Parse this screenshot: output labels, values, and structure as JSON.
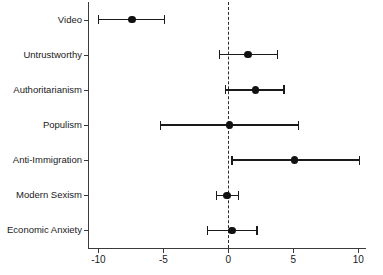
{
  "chart_data": {
    "type": "scatter",
    "plot_style": "coefficient-forest-plot",
    "title": "",
    "subtitle": "",
    "xlabel": "",
    "ylabel": "",
    "grid": false,
    "legend": null,
    "zero_reference_line": {
      "value": 0,
      "style": "dashed"
    },
    "xlim": [
      -10.8,
      10.6
    ],
    "xticks": [
      -10,
      -5,
      0,
      5,
      10
    ],
    "xticklabels": [
      "-10",
      "-5",
      "0",
      "5",
      "10"
    ],
    "categories": [
      "Video",
      "Untrustworthy",
      "Authoritarianism",
      "Populism",
      "Anti-Immigration",
      "Modern Sexism",
      "Economic Anxiety"
    ],
    "estimates": [
      -7.4,
      1.5,
      2.1,
      0.1,
      5.1,
      -0.1,
      0.3
    ],
    "ci_low": [
      -10.0,
      -0.7,
      -0.2,
      -5.2,
      0.3,
      -0.9,
      -1.6
    ],
    "ci_high": [
      -4.9,
      3.8,
      4.3,
      5.4,
      10.1,
      0.8,
      2.2
    ],
    "points": [
      {
        "label": "Video",
        "estimate": -7.4,
        "ci_low": -10.0,
        "ci_high": -4.9
      },
      {
        "label": "Untrustworthy",
        "estimate": 1.5,
        "ci_low": -0.7,
        "ci_high": 3.8
      },
      {
        "label": "Authoritarianism",
        "estimate": 2.1,
        "ci_low": -0.2,
        "ci_high": 4.3
      },
      {
        "label": "Populism",
        "estimate": 0.1,
        "ci_low": -5.2,
        "ci_high": 5.4
      },
      {
        "label": "Anti-Immigration",
        "estimate": 5.1,
        "ci_low": 0.3,
        "ci_high": 10.1
      },
      {
        "label": "Modern Sexism",
        "estimate": -0.1,
        "ci_low": -0.9,
        "ci_high": 0.8
      },
      {
        "label": "Economic Anxiety",
        "estimate": 0.3,
        "ci_low": -1.6,
        "ci_high": 2.2
      }
    ],
    "colors": {
      "point": "#111111",
      "line": "#1a1a1a",
      "axis": "#3a3a3a",
      "zero_line": "#2b2b2b",
      "background": "#ffffff"
    }
  }
}
